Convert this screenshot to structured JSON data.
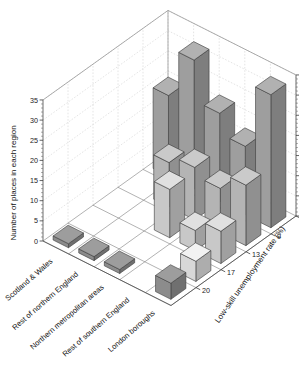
{
  "chart_data": {
    "type": "bar",
    "title": "",
    "subtitle": "",
    "projection": "3d",
    "xlabel": "",
    "ylabel": "Number of places in each region",
    "zlabel": "Low-skill unemployment rate (%)",
    "categories": [
      "Scotland & Wales",
      "Rest of northern England",
      "Northern metropolitan areas",
      "Rest of southern England",
      "London boroughs"
    ],
    "depth_categories": [
      "4",
      "9",
      "13",
      "17",
      "20"
    ],
    "zlim": [
      0,
      35
    ],
    "zticks": [
      0,
      5,
      10,
      15,
      20,
      25,
      30,
      35
    ],
    "ztick_labels": [
      "0",
      "5",
      "10",
      "15",
      "20",
      "25",
      "30",
      "35"
    ],
    "right_axis_ticks": [
      0,
      5,
      10,
      15,
      20,
      25,
      30,
      35
    ],
    "right_axis_tick_labels": [
      "0",
      "5",
      "10",
      "15",
      "20",
      "25",
      "30",
      "35"
    ],
    "grid": true,
    "legend": "none",
    "series": [
      {
        "name": "4",
        "values": [
          20,
          32,
          22,
          17,
          33
        ]
      },
      {
        "name": "9",
        "values": [
          0,
          11,
          13,
          11,
          15
        ]
      },
      {
        "name": "13",
        "values": [
          0,
          0,
          12,
          5,
          8
        ]
      },
      {
        "name": "17",
        "values": [
          0,
          0,
          0,
          0,
          5
        ]
      },
      {
        "name": "20",
        "values": [
          1,
          1,
          1,
          0,
          4
        ]
      }
    ]
  },
  "axes": {
    "left_title": "Number of places in each region",
    "depth_title": "Low-skill unemployment rate (%)"
  },
  "colors": {
    "bar_front_row0": "#9e9e9e",
    "bar_front_row1": "#b4b4b4",
    "bar_front_row2": "#c8c8c8",
    "bar_front_row3": "#d8d8d8",
    "bar_front_row4": "#8c8c8c",
    "outline": "#3a3a3a",
    "grid": "#c9c9c9",
    "axis": "#4a4a4a",
    "background": "#ffffff"
  }
}
